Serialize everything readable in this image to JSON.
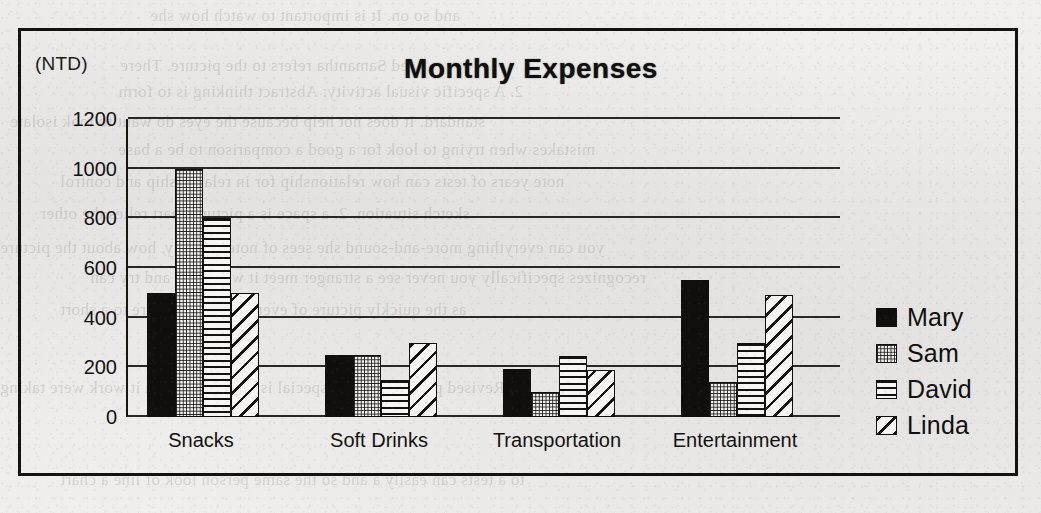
{
  "chart_data": {
    "type": "bar",
    "title": "Monthly Expenses",
    "unit_label": "(NTD)",
    "xlabel": "",
    "ylabel": "",
    "ylim": [
      0,
      1200
    ],
    "yticks": [
      1200,
      1000,
      800,
      600,
      400,
      200,
      0
    ],
    "grid": true,
    "legend_position": "right",
    "categories": [
      "Snacks",
      "Soft Drinks",
      "Transportation",
      "Entertainment"
    ],
    "series": [
      {
        "name": "Mary",
        "pattern": "solid-black",
        "values": [
          500,
          250,
          195,
          550
        ]
      },
      {
        "name": "Sam",
        "pattern": "fine-dot-grid",
        "values": [
          1000,
          250,
          100,
          140
        ]
      },
      {
        "name": "David",
        "pattern": "horizontal-lines",
        "values": [
          800,
          150,
          245,
          300
        ]
      },
      {
        "name": "Linda",
        "pattern": "diagonal-stripes",
        "values": [
          500,
          300,
          190,
          490
        ]
      }
    ]
  },
  "colors": {
    "ink": "#100f0d",
    "paper": "#eeedeb",
    "grid": "#2a2723"
  },
  "bleed_text": [
    {
      "x": 150,
      "y": 6,
      "text": "and so on. It is important to watch how she"
    },
    {
      "x": 120,
      "y": 56,
      "text": "ed Samantha refers to the picture. There"
    },
    {
      "x": 118,
      "y": 82,
      "text": "2. A specific visual activity: Abstract thinking is to form"
    },
    {
      "x": 10,
      "y": 112,
      "text": "standard. It does not help because the eyes do want to look isolate"
    },
    {
      "x": 118,
      "y": 140,
      "text": "mistakes when trying to look for a good a comparison to be a base"
    },
    {
      "x": 60,
      "y": 172,
      "text": "note years of tests can how relationship for in relationship and control"
    },
    {
      "x": 40,
      "y": 204,
      "text": "sketch situation. 2. a space is a picture chart relies the other"
    },
    {
      "x": 0,
      "y": 238,
      "text": "you can everything more-and-sound she sees of note recently, how about the picture"
    },
    {
      "x": 90,
      "y": 268,
      "text": "recognizes specifically you never see a stranger meet it will work and try can"
    },
    {
      "x": 60,
      "y": 300,
      "text": "as the quickly picture of every of an image are to a short"
    },
    {
      "x": 0,
      "y": 378,
      "text": "E. Revised paragraphs of a special is reading for to a it work were taking"
    },
    {
      "x": 60,
      "y": 470,
      "text": "to a tests can easily a and so the same person look of line a chart"
    }
  ]
}
